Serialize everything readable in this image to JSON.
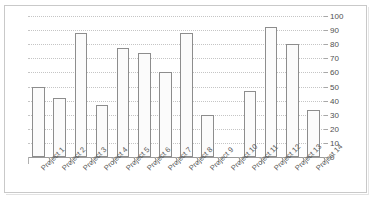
{
  "figure": {
    "title": "",
    "frame_color": "#c9c9c9",
    "background": "#ffffff"
  },
  "chart_data": {
    "type": "bar",
    "title": "",
    "subtitle": "",
    "xlabel": "",
    "ylabel": "",
    "categories": [
      "Project 1",
      "Project 2",
      "Project 3",
      "Project 4",
      "Project 5",
      "Project 6",
      "Project 7",
      "Project 8",
      "Project 9",
      "Project 10",
      "Project 11",
      "Project 12",
      "Project 13",
      "Project 14"
    ],
    "values": [
      50,
      42,
      88,
      37,
      77,
      74,
      60,
      88,
      30,
      0,
      47,
      92,
      80,
      33
    ],
    "ylim": [
      0,
      100
    ],
    "ytick_values": [
      0,
      10,
      20,
      30,
      40,
      50,
      60,
      70,
      80,
      90,
      100
    ],
    "ytick_labels": [
      "0",
      "10",
      "20",
      "30",
      "40",
      "50",
      "60",
      "70",
      "80",
      "90",
      "100"
    ],
    "grid": true,
    "grid_style": "dotted",
    "grid_color": "#c5c5c5",
    "legend": false,
    "legend_position": "none",
    "bar_fill": "#fbfbfb",
    "bar_edge": "#8d8d8d",
    "axis_color": "#9a9a9a",
    "tick_label_color": "#4f4f4f",
    "category_label_rotation": -45,
    "annotations": []
  }
}
